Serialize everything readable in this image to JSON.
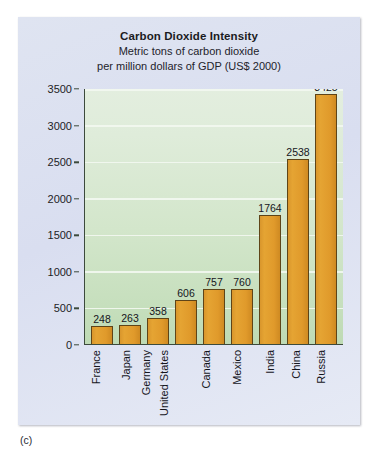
{
  "figure": {
    "caption": "(c)",
    "panel_color": "#dde2f0",
    "plot_background": "#d6e7ce",
    "bar_color": "#e09a2b",
    "bar_border_color": "#5e4418",
    "axis_color": "#3c4a3c",
    "gridline_color": "#f2f7f0"
  },
  "chart_data": {
    "type": "bar",
    "title": "Carbon Dioxide Intensity",
    "subtitle_line1": "Metric tons of carbon dioxide",
    "subtitle_line2": "per million dollars of GDP (US$ 2000)",
    "xlabel": "",
    "ylabel": "",
    "ylim": [
      0,
      3500
    ],
    "ytick_step": 500,
    "grid": true,
    "legend": "none",
    "categories": [
      "France",
      "Japan",
      "Germany",
      "United States",
      "Canada",
      "Mexico",
      "India",
      "China",
      "Russia"
    ],
    "values": [
      248,
      263,
      358,
      606,
      757,
      760,
      1764,
      2538,
      3425
    ],
    "ytick_labels": [
      "0",
      "500",
      "1000",
      "1500",
      "2000",
      "2500",
      "3000",
      "3500"
    ],
    "data_labels": [
      "248",
      "263",
      "358",
      "606",
      "757",
      "760",
      "1764",
      "2538",
      "3425"
    ]
  }
}
